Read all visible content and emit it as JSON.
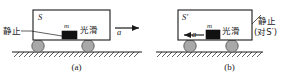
{
  "figure": {
    "type": "physics-diagram",
    "colors": {
      "ink": "#1a1a1a",
      "cart_outline": "#1a1a1a",
      "cart_fill": "#ffffff",
      "block_fill": "#111111",
      "wheel_fill": "#a8a8a8",
      "wheel_outline": "#5a5a5a",
      "ground_line": "#1a1a1a"
    }
  },
  "panels": [
    {
      "id": "a",
      "caption": "(a)",
      "frame_label": "S",
      "mass_label": "m",
      "surface_label": "光滑",
      "accel_label": "a",
      "accel_direction": "right",
      "state_label": "静止",
      "state_qualifier": ""
    },
    {
      "id": "b",
      "caption": "(b)",
      "frame_label": "S′",
      "mass_label": "m",
      "surface_label": "光滑",
      "accel_label": "a",
      "accel_direction": "left",
      "state_label": "静止",
      "state_qualifier": "(对S′)"
    }
  ]
}
